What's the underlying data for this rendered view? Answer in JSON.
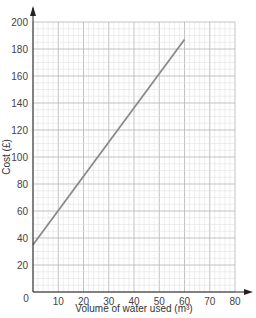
{
  "chart_data": {
    "type": "line",
    "title": "",
    "xlabel": "Volume of water used (m³)",
    "ylabel": "Cost (£)",
    "xlim": [
      0,
      80
    ],
    "ylim": [
      0,
      200
    ],
    "x_ticks": [
      0,
      10,
      20,
      30,
      40,
      50,
      60,
      70,
      80
    ],
    "y_ticks": [
      0,
      20,
      40,
      60,
      80,
      100,
      120,
      140,
      160,
      180,
      200
    ],
    "grid": true,
    "legend": null,
    "series": [
      {
        "name": "Cost",
        "x": [
          0,
          60
        ],
        "y": [
          35,
          187
        ],
        "color": "#8a8a8a"
      }
    ]
  },
  "axes": {
    "x_label": "Volume of water used (m³)",
    "y_label": "Cost (£)"
  },
  "colors": {
    "grid_minor": "#dcdcdc",
    "grid_major": "#b4b4b4",
    "axis": "#222222",
    "line": "#8a8a8a"
  }
}
